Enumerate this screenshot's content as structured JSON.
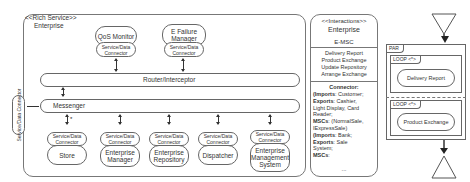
{
  "rich_service": {
    "stereotype": "<<Rich Service>>",
    "name": "Enterprise",
    "top_services": [
      {
        "name": "QoS Monitor",
        "connector": "Service/Data\nConnector"
      },
      {
        "name": "E Failure Manager",
        "connector": "Service/Data\nConnector"
      }
    ],
    "router_label": "Router/Interceptor",
    "messenger_label": "Messenger",
    "side_connector": "Service/Data Connector",
    "star_label": "*",
    "bottom_services": [
      {
        "name": "Store",
        "connector": "Service/Data\nConnector"
      },
      {
        "name": "Enterprise Manager",
        "connector": "Service/Data\nConnector"
      },
      {
        "name": "Enterprise Repository",
        "connector": "Service/Data\nConnector"
      },
      {
        "name": "Dispatcher",
        "connector": "Service/Data\nConnector"
      },
      {
        "name": "Enterprise Management System",
        "connector": "Service/Data\nConnector"
      }
    ]
  },
  "interactions": {
    "stereotype": "<<Interactions>>",
    "name": "Enterprise",
    "msc": "E-MSC",
    "items": [
      "Delivery Report",
      "Product Exchange",
      "Update Repository",
      "Arrange Exchange"
    ],
    "connector_title": "Connector:",
    "connector_lines": [
      {
        "bold": "(Imports",
        "rest": ": Customer;"
      },
      {
        "bold": "Exports",
        "rest": ": Cashier,"
      },
      {
        "bold": "",
        "rest": "Light Display, Card"
      },
      {
        "bold": "",
        "rest": "Reader;"
      },
      {
        "bold": "MSCs",
        "rest": ": (NormalSale,"
      },
      {
        "bold": "",
        "rest": "IExpressSale)"
      },
      {
        "bold": "(Imports",
        "rest": ": Bank;"
      },
      {
        "bold": "Exports",
        "rest": ": Sale"
      },
      {
        "bold": "",
        "rest": "System;"
      },
      {
        "bold": "MSCs",
        "rest": ":"
      }
    ],
    "ellipsis": "..."
  },
  "msc": {
    "par_label": "PAR",
    "loops": [
      {
        "label": "LOOP <*>",
        "body": "Delivery Report"
      },
      {
        "label": "LOOP <*>",
        "body": "Product Exchange"
      }
    ]
  }
}
